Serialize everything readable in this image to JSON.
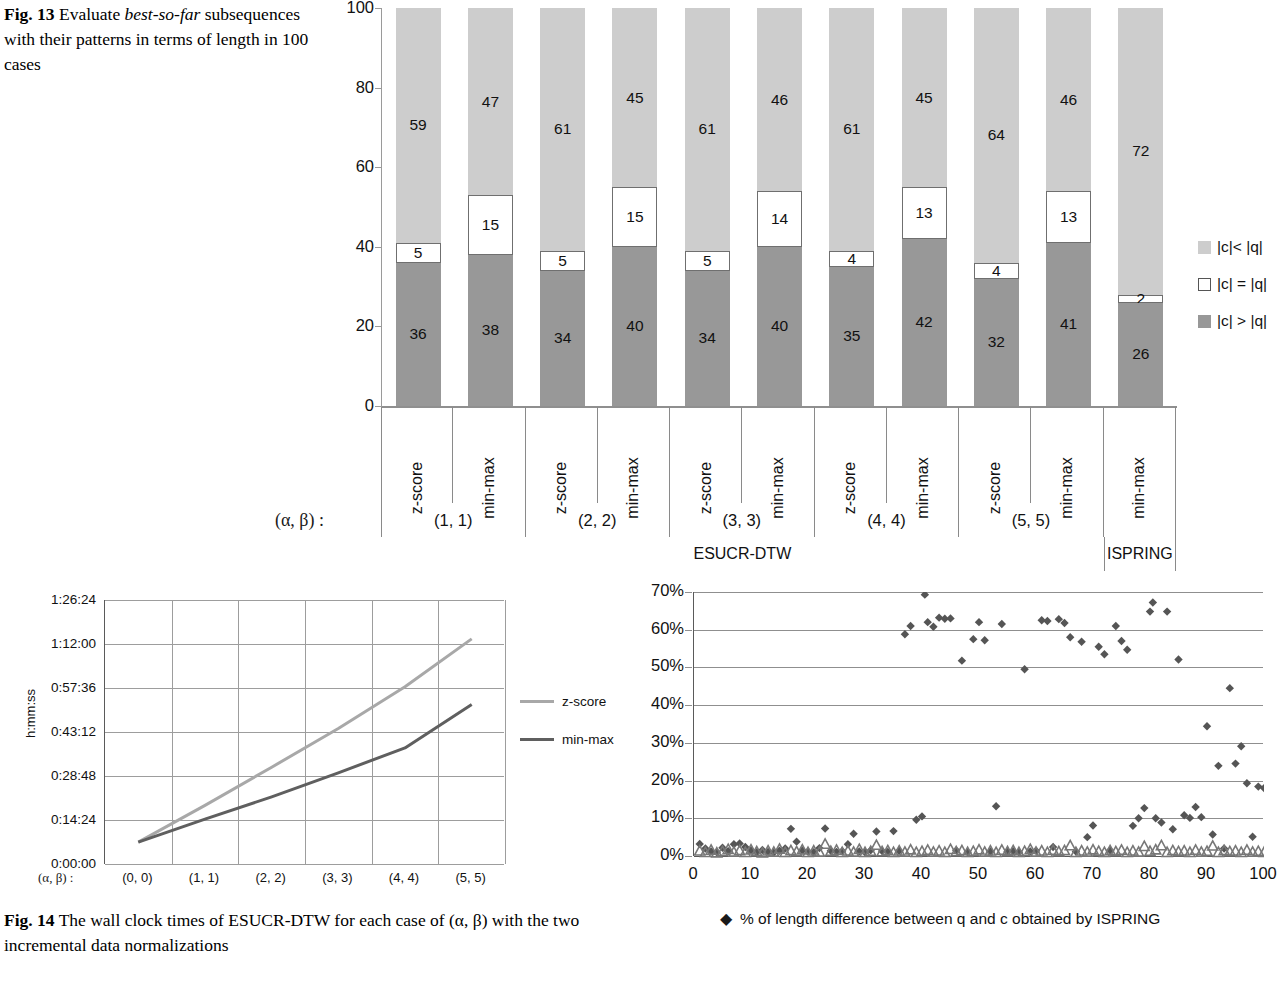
{
  "fig13": {
    "caption_label": "Fig. 13",
    "caption_part1": "Evaluate ",
    "caption_italic": "best-so-far",
    "caption_part2": " subsequences with their patterns in terms of length in 100 cases",
    "axis_greek_label": "(α, β) :",
    "method_esucr": "ESUCR-DTW",
    "method_ispring": "ISPRING",
    "legend": [
      {
        "name": "c-lt-q",
        "label": "|c|< |q|",
        "color": "#cdcdcd"
      },
      {
        "name": "c-eq-q",
        "label": "|c| = |q|",
        "color": "#ffffff"
      },
      {
        "name": "c-gt-q",
        "label": "|c| > |q|",
        "color": "#989898"
      }
    ]
  },
  "fig14": {
    "caption_label": "Fig. 14",
    "caption_text": "The wall clock times of ESUCR-DTW for each case of (α, β) with the two incremental data normalizations",
    "axis_greek_label": "(α, β) :"
  },
  "chart_data": [
    {
      "type": "bar",
      "id": "fig13-stacked-bar",
      "title": "",
      "xlabel": "",
      "ylabel": "",
      "ylim": [
        0,
        100
      ],
      "yticks": [
        "0",
        "20",
        "40",
        "60",
        "80",
        "100"
      ],
      "grid": false,
      "legend_position": "right",
      "stacked": true,
      "categories": [
        "z-score",
        "min-max",
        "z-score",
        "min-max",
        "z-score",
        "min-max",
        "z-score",
        "min-max",
        "z-score",
        "min-max",
        "min-max"
      ],
      "groups": [
        {
          "label": "(1, 1)",
          "span": 2,
          "method": "ESUCR-DTW"
        },
        {
          "label": "(2, 2)",
          "span": 2,
          "method": "ESUCR-DTW"
        },
        {
          "label": "(3, 3)",
          "span": 2,
          "method": "ESUCR-DTW"
        },
        {
          "label": "(4, 4)",
          "span": 2,
          "method": "ESUCR-DTW"
        },
        {
          "label": "(5, 5)",
          "span": 2,
          "method": "ESUCR-DTW"
        },
        {
          "label": "",
          "span": 1,
          "method": "ISPRING"
        }
      ],
      "series": [
        {
          "name": "|c| > |q|",
          "color": "#989898",
          "values": [
            36,
            38,
            34,
            40,
            34,
            40,
            35,
            42,
            32,
            41,
            26
          ]
        },
        {
          "name": "|c| = |q|",
          "color": "#ffffff",
          "values": [
            5,
            15,
            5,
            15,
            5,
            14,
            4,
            13,
            4,
            13,
            2
          ]
        },
        {
          "name": "|c|< |q|",
          "color": "#cdcdcd",
          "values": [
            59,
            47,
            61,
            45,
            61,
            46,
            61,
            45,
            64,
            46,
            72
          ]
        }
      ]
    },
    {
      "type": "line",
      "id": "fig14-wallclock",
      "title": "",
      "xlabel": "",
      "ylabel": "h:mm:ss",
      "grid": true,
      "legend_position": "right",
      "categories": [
        "(0, 0)",
        "(1, 1)",
        "(2, 2)",
        "(3, 3)",
        "(4, 4)",
        "(5, 5)"
      ],
      "yticks": [
        "0:00:00",
        "0:14:24",
        "0:28:48",
        "0:43:12",
        "0:57:36",
        "1:12:00",
        "1:26:24"
      ],
      "ylim_seconds": [
        0,
        5184
      ],
      "series": [
        {
          "name": "z-score",
          "color": "#a8a8a8",
          "values_seconds": [
            430,
            1150,
            1900,
            2660,
            3480,
            4420
          ],
          "values": [
            "0:07:10",
            "0:19:10",
            "0:31:40",
            "0:44:20",
            "0:58:00",
            "1:13:40"
          ]
        },
        {
          "name": "min-max",
          "color": "#5f5f5f",
          "values_seconds": [
            430,
            880,
            1320,
            1790,
            2280,
            3130
          ],
          "values": [
            "0:07:10",
            "0:14:40",
            "0:22:00",
            "0:29:50",
            "0:38:00",
            "0:52:10"
          ]
        }
      ]
    },
    {
      "type": "scatter",
      "id": "fig14-length-difference",
      "title": "",
      "xlabel": "",
      "ylabel": "",
      "grid": true,
      "legend_position": "bottom",
      "xlim": [
        0,
        100
      ],
      "xticks": [
        "0",
        "10",
        "20",
        "30",
        "40",
        "50",
        "60",
        "70",
        "80",
        "90",
        "100"
      ],
      "ylim": [
        0,
        70
      ],
      "yticks": [
        "0%",
        "10%",
        "20%",
        "30%",
        "40%",
        "50%",
        "60%",
        "70%"
      ],
      "series": [
        {
          "name": "% of length difference between q and c obtained by ISPRING",
          "marker": "diamond",
          "color": "#555555",
          "points": [
            [
              1,
              3.2
            ],
            [
              2,
              2.0
            ],
            [
              3,
              1.2
            ],
            [
              4,
              1.0
            ],
            [
              5,
              2.2
            ],
            [
              6,
              1.3
            ],
            [
              7,
              3.1
            ],
            [
              8,
              3.3
            ],
            [
              9,
              2.4
            ],
            [
              10,
              1.5
            ],
            [
              11,
              1.0
            ],
            [
              12,
              1.6
            ],
            [
              13,
              1.1
            ],
            [
              14,
              0.9
            ],
            [
              15,
              1.4
            ],
            [
              16,
              2.0
            ],
            [
              17,
              7.2
            ],
            [
              18,
              3.8
            ],
            [
              19,
              1.5
            ],
            [
              20,
              1.2
            ],
            [
              21,
              1.0
            ],
            [
              22,
              2.1
            ],
            [
              23,
              7.3
            ],
            [
              24,
              1.4
            ],
            [
              25,
              1.1
            ],
            [
              26,
              1.3
            ],
            [
              27,
              3.1
            ],
            [
              28,
              5.9
            ],
            [
              29,
              1.2
            ],
            [
              30,
              1.0
            ],
            [
              31,
              1.5
            ],
            [
              32,
              6.5
            ],
            [
              33,
              1.3
            ],
            [
              34,
              1.1
            ],
            [
              35,
              6.6
            ],
            [
              36,
              1.4
            ],
            [
              37,
              58.8
            ],
            [
              38,
              61.0
            ],
            [
              39,
              9.6
            ],
            [
              40,
              10.5
            ],
            [
              40.5,
              69.3
            ],
            [
              41,
              62.0
            ],
            [
              42,
              60.8
            ],
            [
              43,
              63.2
            ],
            [
              44,
              62.9
            ],
            [
              45,
              63.0
            ],
            [
              46,
              1.5
            ],
            [
              47,
              51.8
            ],
            [
              48,
              1.0
            ],
            [
              49,
              57.5
            ],
            [
              50,
              62.0
            ],
            [
              51,
              57.2
            ],
            [
              52,
              1.2
            ],
            [
              53,
              13.2
            ],
            [
              54,
              61.5
            ],
            [
              55,
              1.1
            ],
            [
              56,
              1.3
            ],
            [
              57,
              1.0
            ],
            [
              58,
              49.5
            ],
            [
              59,
              1.2
            ],
            [
              60,
              1.4
            ],
            [
              61,
              62.5
            ],
            [
              62,
              62.3
            ],
            [
              63,
              2.4
            ],
            [
              64,
              62.8
            ],
            [
              65,
              61.8
            ],
            [
              66,
              58.0
            ],
            [
              67,
              1.2
            ],
            [
              68,
              56.8
            ],
            [
              69,
              5.0
            ],
            [
              70,
              8.1
            ],
            [
              71,
              55.5
            ],
            [
              72,
              53.5
            ],
            [
              73,
              1.5
            ],
            [
              74,
              61.0
            ],
            [
              75,
              57.0
            ],
            [
              76,
              54.7
            ],
            [
              77,
              8.0
            ],
            [
              78,
              10.0
            ],
            [
              79,
              12.7
            ],
            [
              80,
              64.8
            ],
            [
              80.5,
              67.2
            ],
            [
              81,
              10.0
            ],
            [
              82,
              8.9
            ],
            [
              83,
              64.8
            ],
            [
              84,
              7.1
            ],
            [
              85,
              52.1
            ],
            [
              86,
              10.8
            ],
            [
              87,
              10.1
            ],
            [
              88,
              13.0
            ],
            [
              89,
              10.3
            ],
            [
              90,
              34.4
            ],
            [
              91,
              5.7
            ],
            [
              92,
              23.9
            ],
            [
              93,
              2.0
            ],
            [
              94,
              44.5
            ],
            [
              95,
              24.5
            ],
            [
              96,
              29.1
            ],
            [
              97,
              19.3
            ],
            [
              98,
              5.1
            ],
            [
              99,
              18.4
            ],
            [
              100,
              18.0
            ]
          ]
        },
        {
          "name": "esucr-triangles",
          "marker": "triangle",
          "color": "#777777",
          "points": [
            [
              1,
              1.4
            ],
            [
              2,
              1.0
            ],
            [
              3,
              1.6
            ],
            [
              4,
              0.9
            ],
            [
              5,
              1.3
            ],
            [
              6,
              1.8
            ],
            [
              7,
              1.1
            ],
            [
              8,
              1.5
            ],
            [
              9,
              1.0
            ],
            [
              10,
              1.7
            ],
            [
              11,
              1.2
            ],
            [
              12,
              0.9
            ],
            [
              13,
              1.4
            ],
            [
              14,
              1.1
            ],
            [
              15,
              1.9
            ],
            [
              16,
              1.0
            ],
            [
              17,
              1.5
            ],
            [
              18,
              1.2
            ],
            [
              19,
              1.7
            ],
            [
              20,
              1.0
            ],
            [
              21,
              1.4
            ],
            [
              22,
              1.1
            ],
            [
              23,
              3.2
            ],
            [
              24,
              1.3
            ],
            [
              25,
              1.6
            ],
            [
              26,
              1.0
            ],
            [
              27,
              1.4
            ],
            [
              28,
              1.1
            ],
            [
              29,
              1.8
            ],
            [
              30,
              1.0
            ],
            [
              31,
              1.3
            ],
            [
              32,
              2.9
            ],
            [
              33,
              1.2
            ],
            [
              34,
              1.5
            ],
            [
              35,
              1.0
            ],
            [
              36,
              1.4
            ],
            [
              37,
              1.1
            ],
            [
              38,
              1.7
            ],
            [
              39,
              1.0
            ],
            [
              40,
              1.3
            ],
            [
              41,
              1.6
            ],
            [
              42,
              1.1
            ],
            [
              43,
              1.4
            ],
            [
              44,
              1.0
            ],
            [
              45,
              1.8
            ],
            [
              46,
              1.2
            ],
            [
              47,
              1.5
            ],
            [
              48,
              1.0
            ],
            [
              49,
              1.3
            ],
            [
              50,
              1.7
            ],
            [
              51,
              1.1
            ],
            [
              52,
              1.4
            ],
            [
              53,
              1.0
            ],
            [
              54,
              1.6
            ],
            [
              55,
              1.2
            ],
            [
              56,
              1.5
            ],
            [
              57,
              1.0
            ],
            [
              58,
              1.3
            ],
            [
              59,
              1.8
            ],
            [
              60,
              1.1
            ],
            [
              61,
              1.4
            ],
            [
              62,
              1.0
            ],
            [
              63,
              1.6
            ],
            [
              64,
              1.2
            ],
            [
              65,
              1.5
            ],
            [
              66,
              2.8
            ],
            [
              67,
              1.0
            ],
            [
              68,
              1.4
            ],
            [
              69,
              1.1
            ],
            [
              70,
              1.7
            ],
            [
              71,
              1.3
            ],
            [
              72,
              1.0
            ],
            [
              73,
              1.5
            ],
            [
              74,
              1.2
            ],
            [
              75,
              1.6
            ],
            [
              76,
              1.0
            ],
            [
              77,
              1.4
            ],
            [
              78,
              1.1
            ],
            [
              79,
              2.6
            ],
            [
              80,
              1.3
            ],
            [
              81,
              1.7
            ],
            [
              82,
              2.8
            ],
            [
              83,
              1.0
            ],
            [
              84,
              1.5
            ],
            [
              85,
              1.2
            ],
            [
              86,
              1.4
            ],
            [
              87,
              1.0
            ],
            [
              88,
              1.6
            ],
            [
              89,
              1.1
            ],
            [
              90,
              1.3
            ],
            [
              91,
              2.7
            ],
            [
              92,
              1.0
            ],
            [
              93,
              1.5
            ],
            [
              94,
              1.2
            ],
            [
              95,
              1.4
            ],
            [
              96,
              1.0
            ],
            [
              97,
              1.6
            ],
            [
              98,
              1.1
            ],
            [
              99,
              1.3
            ],
            [
              100,
              1.0
            ]
          ]
        }
      ],
      "legend_label": "% of length difference between q and c obtained by ISPRING",
      "legend_marker": "◆"
    }
  ]
}
